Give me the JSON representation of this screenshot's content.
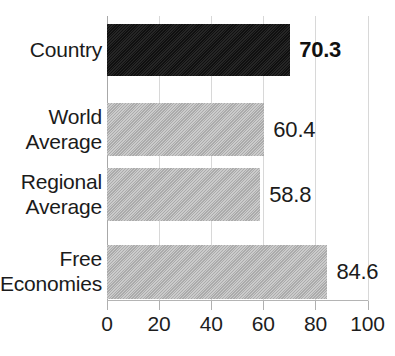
{
  "chart_data": {
    "type": "bar",
    "orientation": "horizontal",
    "title": "",
    "title_visible": false,
    "xlabel": "",
    "ylabel": "",
    "xlim": [
      0,
      100
    ],
    "grid": true,
    "legend": false,
    "categories": [
      "Country",
      "World Average",
      "Regional Average",
      "Free Economies"
    ],
    "values": [
      70.3,
      60.4,
      58.8,
      84.6
    ],
    "value_labels": [
      "70.3",
      "60.4",
      "58.8",
      "84.6"
    ],
    "xticks": [
      0,
      20,
      40,
      60,
      80,
      100
    ],
    "xtick_labels": [
      "0",
      "20",
      "40",
      "60",
      "80",
      "100"
    ],
    "bar_colors": [
      "#151515",
      "#b4b4b4",
      "#b4b4b4",
      "#b4b4b4"
    ],
    "highlight_index": 0
  },
  "axis": {
    "ticks": [
      {
        "label": "0",
        "value": 0
      },
      {
        "label": "20",
        "value": 20
      },
      {
        "label": "40",
        "value": 40
      },
      {
        "label": "60",
        "value": 60
      },
      {
        "label": "80",
        "value": 80
      },
      {
        "label": "100",
        "value": 100
      }
    ]
  },
  "bars": [
    {
      "category": "Country",
      "label_lines": "Country",
      "value": 70.3,
      "value_label": "70.3",
      "color": "#151515",
      "emphasis": true
    },
    {
      "category": "World Average",
      "label_lines": "World\nAverage",
      "value": 60.4,
      "value_label": "60.4",
      "color": "#b4b4b4",
      "emphasis": false
    },
    {
      "category": "Regional Average",
      "label_lines": "Regional\nAverage",
      "value": 58.8,
      "value_label": "58.8",
      "color": "#b4b4b4",
      "emphasis": false
    },
    {
      "category": "Free Economies",
      "label_lines": "Free\nEconomies",
      "value": 84.6,
      "value_label": "84.6",
      "color": "#b4b4b4",
      "emphasis": false
    }
  ]
}
